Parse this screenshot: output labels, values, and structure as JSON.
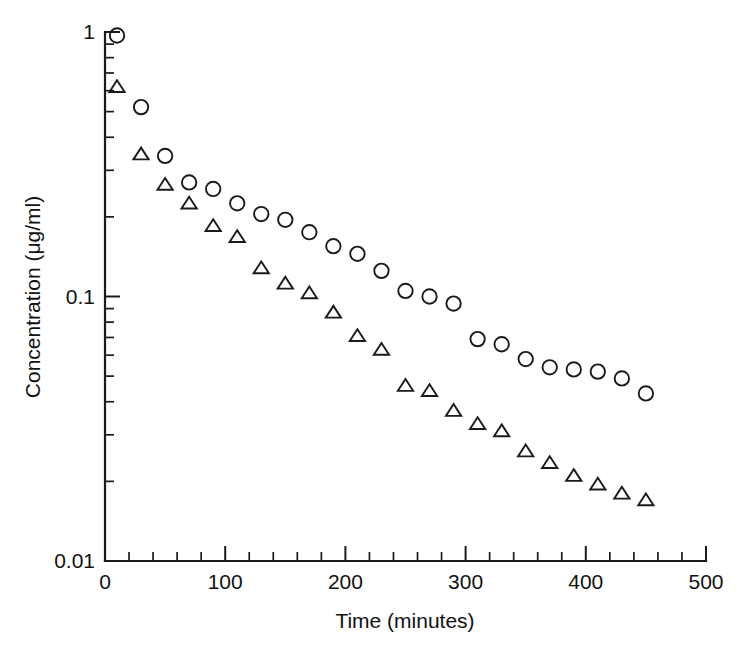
{
  "chart_data": {
    "type": "scatter",
    "title": "",
    "xlabel": "Time (minutes)",
    "ylabel": "Concentration (μg/ml)",
    "yscale": "log",
    "xscale": "linear",
    "xlim": [
      0,
      500
    ],
    "ylim": [
      0.01,
      1
    ],
    "grid": false,
    "legend": "none",
    "x_ticks_major": [
      0,
      100,
      200,
      300,
      400,
      500
    ],
    "x_tick_labels": [
      "0",
      "100",
      "200",
      "300",
      "400",
      "500"
    ],
    "x_tick_minor_step": 20,
    "y_ticks_major": [
      1,
      0.1,
      0.01
    ],
    "y_tick_labels": [
      "1",
      "0.1",
      "0.01"
    ],
    "y_ticks_minor": [
      0.9,
      0.8,
      0.7,
      0.6,
      0.5,
      0.4,
      0.3,
      0.2,
      0.09,
      0.08,
      0.07,
      0.06,
      0.05,
      0.04,
      0.03,
      0.02
    ],
    "series": [
      {
        "name": "circles",
        "marker": "open-circle",
        "color": "#1a1a1a",
        "x": [
          10,
          30,
          50,
          70,
          90,
          110,
          130,
          150,
          170,
          190,
          210,
          230,
          250,
          270,
          290,
          310,
          330,
          350,
          370,
          390,
          410,
          430,
          450
        ],
        "y": [
          0.97,
          0.52,
          0.34,
          0.27,
          0.255,
          0.225,
          0.205,
          0.195,
          0.175,
          0.155,
          0.145,
          0.125,
          0.105,
          0.1,
          0.094,
          0.069,
          0.066,
          0.058,
          0.054,
          0.053,
          0.052,
          0.049,
          0.043
        ]
      },
      {
        "name": "triangles",
        "marker": "open-triangle",
        "color": "#1a1a1a",
        "x": [
          10,
          30,
          50,
          70,
          90,
          110,
          130,
          150,
          170,
          190,
          210,
          230,
          250,
          270,
          290,
          310,
          330,
          350,
          370,
          390,
          410,
          430,
          450
        ],
        "y": [
          0.62,
          0.345,
          0.265,
          0.225,
          0.185,
          0.168,
          0.128,
          0.112,
          0.103,
          0.087,
          0.071,
          0.063,
          0.046,
          0.044,
          0.037,
          0.033,
          0.031,
          0.026,
          0.0235,
          0.021,
          0.0195,
          0.018,
          0.017
        ]
      }
    ]
  },
  "axes": {
    "x_axis_label": "Time (minutes)",
    "y_axis_label": "Concentration (μg/ml)"
  }
}
